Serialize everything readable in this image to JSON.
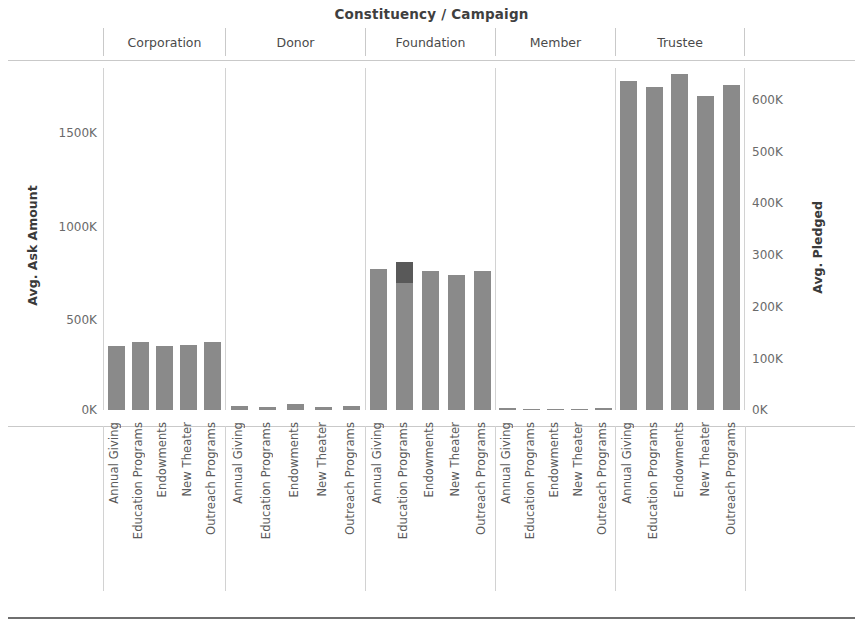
{
  "chart_data": {
    "type": "bar",
    "title": "Constituency / Campaign",
    "subtype": "stacked-bar-small-multiples",
    "xlabel": "",
    "ylabel": "Avg. Ask Amount",
    "y2label": "Avg. Pledged",
    "ylim": [
      0,
      1850000
    ],
    "y2lim": [
      0,
      670000
    ],
    "grid": false,
    "legend": "none",
    "y_ticks": [
      "0K",
      "500K",
      "1000K",
      "1500K"
    ],
    "y_tick_values": [
      0,
      500000,
      1000000,
      1500000
    ],
    "y2_ticks": [
      "0K",
      "100K",
      "200K",
      "300K",
      "400K",
      "500K",
      "600K"
    ],
    "y2_tick_values": [
      0,
      100000,
      200000,
      300000,
      400000,
      500000,
      600000
    ],
    "categories": [
      "Annual Giving",
      "Education Programs",
      "Endowments",
      "New Theater",
      "Outreach Programs"
    ],
    "panels": [
      "Corporation",
      "Donor",
      "Foundation",
      "Member",
      "Trustee"
    ],
    "series": [
      {
        "name": "Avg. Ask Amount",
        "color": "#595959"
      },
      {
        "name": "Avg. Pledged",
        "color": "#8a8a8a"
      }
    ],
    "panel_data": [
      {
        "panel": "Corporation",
        "ask_amount": [
          345000,
          370000,
          345000,
          350000,
          370000
        ],
        "pledged": [
          205000,
          200000,
          200000,
          195000,
          205000
        ]
      },
      {
        "panel": "Donor",
        "ask_amount": [
          22000,
          18000,
          30000,
          17000,
          22000
        ],
        "pledged": [
          12000,
          9000,
          17000,
          9000,
          12000
        ]
      },
      {
        "panel": "Foundation",
        "ask_amount": [
          765000,
          800000,
          750000,
          730000,
          750000
        ],
        "pledged": [
          395000,
          275000,
          390000,
          480000,
          440000
        ]
      },
      {
        "panel": "Member",
        "ask_amount": [
          9000,
          7000,
          7000,
          6000,
          11000
        ],
        "pledged": [
          5000,
          4000,
          4000,
          3000,
          6000
        ]
      },
      {
        "panel": "Trustee",
        "ask_amount": [
          1780000,
          1750000,
          1820000,
          1700000,
          1760000
        ],
        "pledged": [
          1280000,
          1000000,
          1820000,
          1220000,
          1000000
        ]
      }
    ]
  },
  "axes": {
    "left": {
      "title": "Avg. Ask Amount",
      "ticks": [
        {
          "label": "1500K",
          "top": 126
        },
        {
          "label": "1000K",
          "top": 220
        },
        {
          "label": "500K",
          "top": 313
        },
        {
          "label": "0K",
          "top": 403
        }
      ]
    },
    "right": {
      "title": "Avg. Pledged",
      "ticks": [
        {
          "label": "600K",
          "top": 93
        },
        {
          "label": "500K",
          "top": 145
        },
        {
          "label": "400K",
          "top": 196
        },
        {
          "label": "300K",
          "top": 248
        },
        {
          "label": "200K",
          "top": 300
        },
        {
          "label": "100K",
          "top": 352
        },
        {
          "label": "0K",
          "top": 403
        }
      ]
    }
  },
  "colors": {
    "dark_segment": "#595959",
    "light_segment": "#8a8a8a",
    "rule": "#c9c9c9",
    "bottom_rule": "#6f6f6f",
    "text": "#4a4a4a"
  }
}
